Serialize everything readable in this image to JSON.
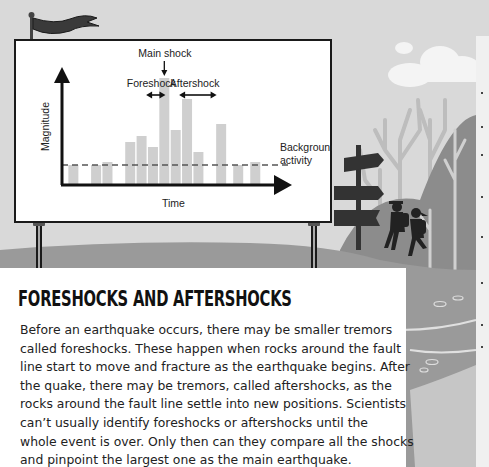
{
  "article": {
    "title": "FORESHOCKS AND AFTERSHOCKS",
    "body_lines": [
      "Before an earthquake occurs, there may be smaller tremors",
      "called foreshocks. These happen when rocks around the fault",
      "line start to move and fracture as the earthquake begins. After",
      "the quake, there may be tremors, called aftershocks, as the",
      "rocks around the fault line settle into new positions. Scientists",
      "can’t usually identify foreshocks or aftershocks until the",
      "whole event is over. Only then can they compare all the shocks",
      "and pinpoint the largest one as the main earthquake."
    ]
  },
  "colors": {
    "background": "#d9d9d9",
    "ground": "#9a9a9a",
    "bar": "#cfcfcf",
    "ink": "#1a1a1a",
    "flag": "#3a3a3a",
    "hill": "#8c8c8c",
    "tree": "#bdbdbd"
  },
  "icons": {
    "flag": "flag-icon",
    "signpost": "signpost-icon",
    "hikers": "hikers-icon",
    "cloud": "cloud-icon"
  },
  "chart_data": {
    "type": "bar",
    "title": "",
    "xlabel": "Time",
    "ylabel": "Magnitude",
    "ylim": [
      0,
      12
    ],
    "grid": false,
    "legend": "none",
    "x": [
      1,
      3,
      4,
      6,
      7,
      8,
      9,
      10,
      11,
      12,
      14,
      15.5,
      17
    ],
    "values": [
      2.0,
      2.0,
      2.3,
      4.3,
      4.9,
      3.8,
      10.7,
      5.5,
      8.6,
      3.3,
      6.1,
      2.0,
      2.3
    ],
    "xlim": [
      0,
      19
    ],
    "reference_line": {
      "label": "Background activity",
      "value": 2.0,
      "style": "dashed"
    },
    "annotations": [
      {
        "label": "Main shock",
        "type": "down-arrow",
        "target_index": 6
      },
      {
        "label": "Foreshock",
        "type": "double-arrow",
        "from_x": 7.4,
        "to_x": 9.1
      },
      {
        "label": "Aftershock",
        "type": "double-arrow",
        "from_x": 10.3,
        "to_x": 13.6
      }
    ]
  }
}
